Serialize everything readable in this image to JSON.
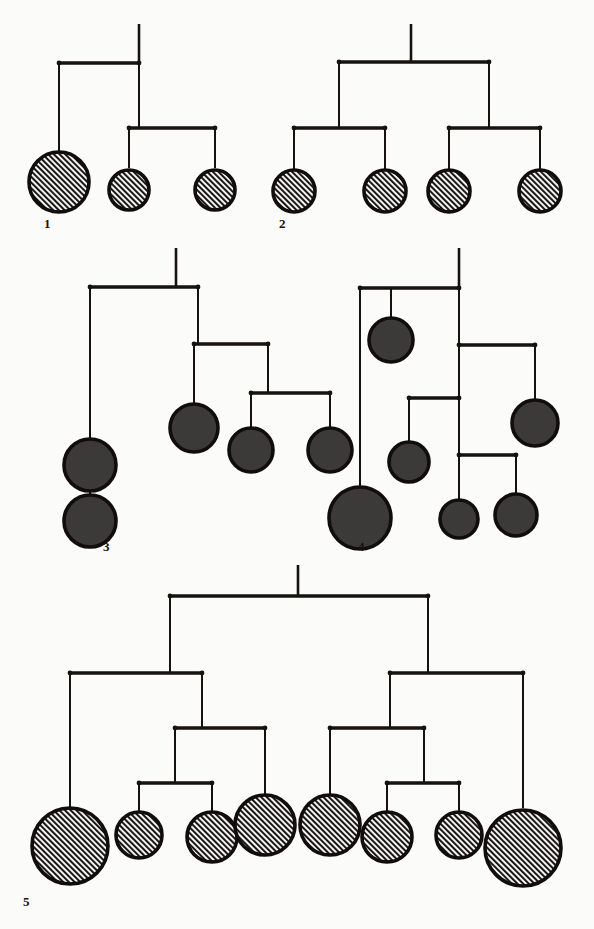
{
  "figure": {
    "kind": "mobile-tree-diagram-plate",
    "background_color": "#fbfbfa",
    "ink_color": "#16130f",
    "hatch_fill_color": "#2b2724",
    "solid_fill_color": "#3c3a38",
    "disc_outline_color": "#100d0b",
    "caption_note": "",
    "mobiles": [
      {
        "id": "mobile-1",
        "label": "1",
        "label_x": 44,
        "label_y": 228,
        "disc_style": "hatched",
        "stem": {
          "x": 139,
          "y1": 24,
          "y2": 63
        },
        "bars": [
          {
            "name": "bar-root",
            "y": 63,
            "x1": 59,
            "x2": 139
          },
          {
            "name": "bar-right",
            "y": 128,
            "x1": 129,
            "x2": 215
          }
        ],
        "drops": [
          {
            "name": "drop-to-disc-a",
            "x": 59,
            "y1": 63,
            "y2": 152
          },
          {
            "name": "drop-root-to-bar-right",
            "x": 139,
            "y1": 63,
            "y2": 128
          },
          {
            "name": "drop-to-disc-b",
            "x": 129,
            "y1": 128,
            "y2": 168
          },
          {
            "name": "drop-to-disc-c",
            "x": 215,
            "y1": 128,
            "y2": 168
          }
        ],
        "discs": [
          {
            "name": "disc-1a",
            "cx": 59,
            "cy": 182,
            "r": 30
          },
          {
            "name": "disc-1b",
            "cx": 129,
            "cy": 190,
            "r": 20
          },
          {
            "name": "disc-1c",
            "cx": 215,
            "cy": 190,
            "r": 20
          }
        ]
      },
      {
        "id": "mobile-2",
        "label": "2",
        "label_x": 279,
        "label_y": 228,
        "disc_style": "hatched",
        "stem": {
          "x": 411,
          "y1": 24,
          "y2": 62
        },
        "bars": [
          {
            "name": "bar-root",
            "y": 62,
            "x1": 339,
            "x2": 489
          },
          {
            "name": "bar-left",
            "y": 128,
            "x1": 294,
            "x2": 385
          },
          {
            "name": "bar-right",
            "y": 128,
            "x1": 449,
            "x2": 540
          }
        ],
        "drops": [
          {
            "name": "drop-root-left",
            "x": 339,
            "y1": 62,
            "y2": 128
          },
          {
            "name": "drop-root-right",
            "x": 489,
            "y1": 62,
            "y2": 128
          },
          {
            "name": "drop-to-disc-a",
            "x": 294,
            "y1": 128,
            "y2": 170
          },
          {
            "name": "drop-to-disc-b",
            "x": 385,
            "y1": 128,
            "y2": 170
          },
          {
            "name": "drop-to-disc-c",
            "x": 449,
            "y1": 128,
            "y2": 170
          },
          {
            "name": "drop-to-disc-d",
            "x": 540,
            "y1": 128,
            "y2": 170
          }
        ],
        "discs": [
          {
            "name": "disc-2a",
            "cx": 294,
            "cy": 191,
            "r": 21
          },
          {
            "name": "disc-2b",
            "cx": 385,
            "cy": 191,
            "r": 21
          },
          {
            "name": "disc-2c",
            "cx": 449,
            "cy": 191,
            "r": 21
          },
          {
            "name": "disc-2d",
            "cx": 540,
            "cy": 191,
            "r": 21
          }
        ]
      },
      {
        "id": "mobile-3",
        "label": "3",
        "label_x": 103,
        "label_y": 551,
        "disc_style": "solid",
        "stem": {
          "x": 176,
          "y1": 248,
          "y2": 287
        },
        "bars": [
          {
            "name": "bar-root",
            "y": 287,
            "x1": 90,
            "x2": 198
          },
          {
            "name": "bar-mid",
            "y": 344,
            "x1": 194,
            "x2": 268
          },
          {
            "name": "bar-low",
            "y": 393,
            "x1": 251,
            "x2": 330
          }
        ],
        "drops": [
          {
            "name": "drop-to-disc-a",
            "x": 90,
            "y1": 287,
            "y2": 440
          },
          {
            "name": "drop-root-to-mid",
            "x": 198,
            "y1": 287,
            "y2": 344
          },
          {
            "name": "drop-to-disc-b",
            "x": 194,
            "y1": 344,
            "y2": 405
          },
          {
            "name": "drop-mid-to-low",
            "x": 268,
            "y1": 344,
            "y2": 393
          },
          {
            "name": "drop-to-disc-c",
            "x": 251,
            "y1": 393,
            "y2": 428
          },
          {
            "name": "drop-to-disc-d",
            "x": 330,
            "y1": 393,
            "y2": 428
          },
          {
            "name": "drop-disc-a-to-disc-e",
            "x": 90,
            "y1": 477,
            "y2": 495
          }
        ],
        "discs": [
          {
            "name": "disc-3a",
            "cx": 90,
            "cy": 465,
            "r": 26
          },
          {
            "name": "disc-3b",
            "cx": 194,
            "cy": 428,
            "r": 24
          },
          {
            "name": "disc-3c",
            "cx": 251,
            "cy": 450,
            "r": 22
          },
          {
            "name": "disc-3d",
            "cx": 330,
            "cy": 450,
            "r": 22
          },
          {
            "name": "disc-3e",
            "cx": 90,
            "cy": 521,
            "r": 26
          }
        ]
      },
      {
        "id": "mobile-4",
        "label": "4",
        "label_x": 358,
        "label_y": 551,
        "disc_style": "solid",
        "stem": {
          "x": 459,
          "y1": 248,
          "y2": 288
        },
        "bars": [
          {
            "name": "bar-root",
            "y": 288,
            "x1": 360,
            "x2": 459
          },
          {
            "name": "bar-second",
            "y": 345,
            "x1": 459,
            "x2": 535
          },
          {
            "name": "bar-third",
            "y": 398,
            "x1": 409,
            "x2": 459
          },
          {
            "name": "bar-fourth",
            "y": 455,
            "x1": 459,
            "x2": 516
          }
        ],
        "drops": [
          {
            "name": "drop-to-disc-big",
            "x": 360,
            "y1": 288,
            "y2": 490
          },
          {
            "name": "drop-to-disc-top",
            "x": 391,
            "y1": 288,
            "y2": 318
          },
          {
            "name": "drop-root-to-second",
            "x": 459,
            "y1": 288,
            "y2": 345
          },
          {
            "name": "drop-second-to-third",
            "x": 459,
            "y1": 345,
            "y2": 398
          },
          {
            "name": "drop-to-disc-right",
            "x": 535,
            "y1": 345,
            "y2": 400
          },
          {
            "name": "drop-to-disc-mid",
            "x": 409,
            "y1": 398,
            "y2": 442
          },
          {
            "name": "drop-third-to-fourth",
            "x": 459,
            "y1": 398,
            "y2": 455
          },
          {
            "name": "drop-to-disc-e",
            "x": 459,
            "y1": 455,
            "y2": 500
          },
          {
            "name": "drop-to-disc-f",
            "x": 516,
            "y1": 455,
            "y2": 494
          }
        ],
        "discs": [
          {
            "name": "disc-4-top",
            "cx": 391,
            "cy": 340,
            "r": 22
          },
          {
            "name": "disc-4-right",
            "cx": 535,
            "cy": 423,
            "r": 23
          },
          {
            "name": "disc-4-mid",
            "cx": 409,
            "cy": 462,
            "r": 20
          },
          {
            "name": "disc-4-big",
            "cx": 360,
            "cy": 518,
            "r": 31
          },
          {
            "name": "disc-4-e",
            "cx": 459,
            "cy": 519,
            "r": 19
          },
          {
            "name": "disc-4-f",
            "cx": 516,
            "cy": 515,
            "r": 21
          }
        ]
      },
      {
        "id": "mobile-5",
        "label": "5",
        "label_x": 23,
        "label_y": 906,
        "disc_style": "hatched",
        "stem": {
          "x": 298,
          "y1": 565,
          "y2": 596
        },
        "bars": [
          {
            "name": "bar-root",
            "y": 596,
            "x1": 170,
            "x2": 428
          },
          {
            "name": "bar-L1",
            "y": 673,
            "x1": 70,
            "x2": 202
          },
          {
            "name": "bar-R1",
            "y": 673,
            "x1": 390,
            "x2": 523
          },
          {
            "name": "bar-L2",
            "y": 728,
            "x1": 175,
            "x2": 265
          },
          {
            "name": "bar-R2",
            "y": 728,
            "x1": 330,
            "x2": 424
          },
          {
            "name": "bar-L3",
            "y": 783,
            "x1": 139,
            "x2": 212
          },
          {
            "name": "bar-R3",
            "y": 783,
            "x1": 387,
            "x2": 459
          }
        ],
        "drops": [
          {
            "name": "drop-root-left",
            "x": 170,
            "y1": 596,
            "y2": 673
          },
          {
            "name": "drop-root-right",
            "x": 428,
            "y1": 596,
            "y2": 673
          },
          {
            "name": "drop-L1-outer",
            "x": 70,
            "y1": 673,
            "y2": 808
          },
          {
            "name": "drop-L1-to-L2",
            "x": 202,
            "y1": 673,
            "y2": 728
          },
          {
            "name": "drop-L2-to-L3",
            "x": 175,
            "y1": 728,
            "y2": 783
          },
          {
            "name": "drop-L2-outer",
            "x": 265,
            "y1": 728,
            "y2": 795
          },
          {
            "name": "drop-L3-a",
            "x": 139,
            "y1": 783,
            "y2": 812
          },
          {
            "name": "drop-L3-b",
            "x": 212,
            "y1": 783,
            "y2": 812
          },
          {
            "name": "drop-R1-to-R2",
            "x": 390,
            "y1": 673,
            "y2": 728
          },
          {
            "name": "drop-R1-outer",
            "x": 523,
            "y1": 673,
            "y2": 808
          },
          {
            "name": "drop-R2-outer",
            "x": 330,
            "y1": 728,
            "y2": 795
          },
          {
            "name": "drop-R2-to-R3",
            "x": 424,
            "y1": 728,
            "y2": 783
          },
          {
            "name": "drop-R3-a",
            "x": 387,
            "y1": 783,
            "y2": 812
          },
          {
            "name": "drop-R3-b",
            "x": 459,
            "y1": 783,
            "y2": 812
          }
        ],
        "discs": [
          {
            "name": "disc-5a",
            "cx": 70,
            "cy": 846,
            "r": 38
          },
          {
            "name": "disc-5b",
            "cx": 139,
            "cy": 835,
            "r": 23
          },
          {
            "name": "disc-5c",
            "cx": 212,
            "cy": 837,
            "r": 25
          },
          {
            "name": "disc-5d",
            "cx": 265,
            "cy": 825,
            "r": 30
          },
          {
            "name": "disc-5e",
            "cx": 330,
            "cy": 825,
            "r": 30
          },
          {
            "name": "disc-5f",
            "cx": 387,
            "cy": 837,
            "r": 25
          },
          {
            "name": "disc-5g",
            "cx": 459,
            "cy": 835,
            "r": 23
          },
          {
            "name": "disc-5h",
            "cx": 523,
            "cy": 848,
            "r": 38
          }
        ]
      }
    ]
  }
}
